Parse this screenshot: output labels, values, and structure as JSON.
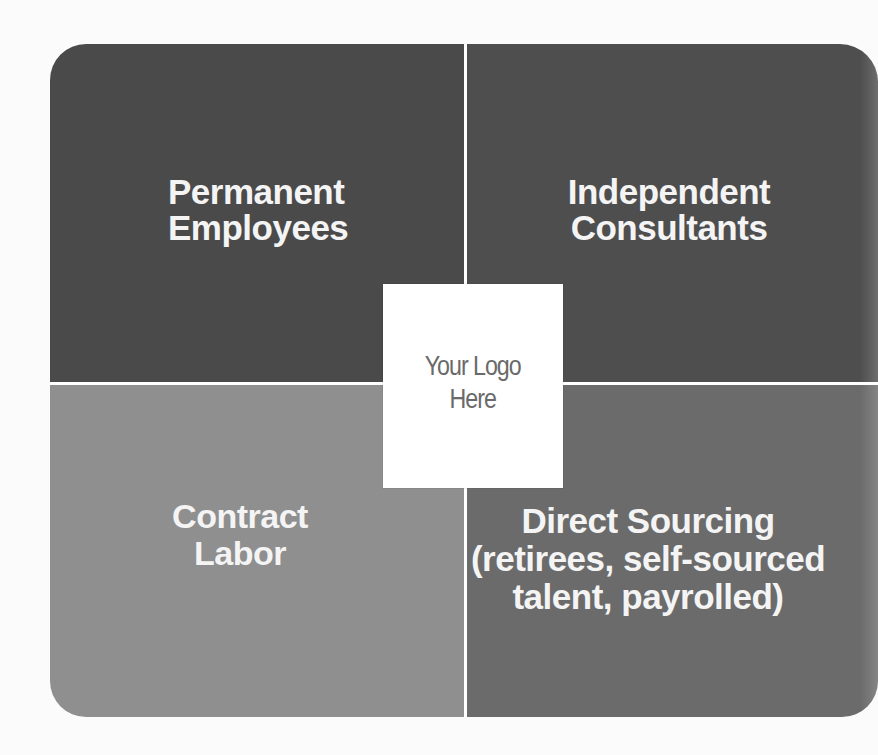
{
  "diagram": {
    "type": "quadrant",
    "colors": {
      "top_left": "#4a4a4a",
      "top_right": "#4e4e4e",
      "bottom_left": "#8f8f8f",
      "bottom_right": "#6b6b6b",
      "divider": "#ffffff",
      "label_text": "#f4f4f4",
      "logo_text": "#6a6a6a"
    },
    "quadrants": [
      {
        "position": "top-left",
        "label": "Permanent\nEmployees"
      },
      {
        "position": "top-right",
        "label": "Independent\nConsultants"
      },
      {
        "position": "bottom-left",
        "label": "Contract\nLabor"
      },
      {
        "position": "bottom-right",
        "label": "Direct Sourcing\n(retirees, self-sourced\ntalent, payrolled)"
      }
    ],
    "center": {
      "label": "Your Logo\nHere"
    }
  }
}
